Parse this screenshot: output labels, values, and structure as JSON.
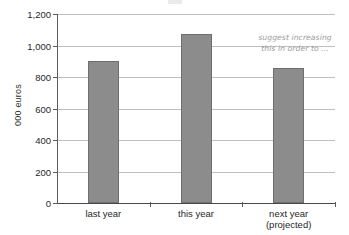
{
  "chart_data": {
    "type": "bar",
    "title": "",
    "subtitle": "",
    "xlabel": "",
    "ylabel": "000 euros",
    "categories": [
      "last year",
      "this year",
      "next year (projected)"
    ],
    "category_lines": [
      [
        "last year"
      ],
      [
        "this year"
      ],
      [
        "next year",
        "(projected)"
      ]
    ],
    "values": [
      900,
      1070,
      860
    ],
    "ylim": [
      0,
      1200
    ],
    "ytick_step": 200,
    "ytick_labels": [
      "0",
      "200",
      "400",
      "600",
      "800",
      "1,000",
      "1,200"
    ],
    "ytick_values": [
      0,
      200,
      400,
      600,
      800,
      1000,
      1200
    ],
    "grid": true,
    "legend": false,
    "legend_position": "none",
    "annotations": [
      {
        "name": "suggest-increasing-note",
        "lines": [
          "suggest increasing",
          "this in order to ..."
        ],
        "text": "suggest increasing this in order to ..."
      }
    ],
    "series": [
      {
        "name": "000 euros",
        "values": [
          900,
          1070,
          860
        ]
      }
    ]
  },
  "style": {
    "bar_fill": "#8c8c8c",
    "bar_stroke": "#6e6e6e",
    "gridline_color": "#bfbfbf",
    "axis_color": "#5a5a5a",
    "annotation_color": "#9a9a9a",
    "background": "#ffffff"
  }
}
